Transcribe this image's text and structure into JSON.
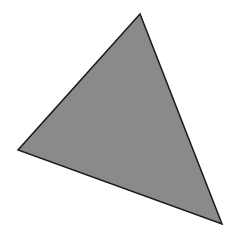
{
  "canvas": {
    "width": 237,
    "height": 236,
    "background": "#ffffff"
  },
  "shape": {
    "type": "triangle",
    "points": [
      {
        "x": 140,
        "y": 14
      },
      {
        "x": 18,
        "y": 150
      },
      {
        "x": 222,
        "y": 224
      }
    ],
    "fill": "#8a8a8a",
    "stroke": "#1a1a1a",
    "stroke_width": 1.5
  }
}
